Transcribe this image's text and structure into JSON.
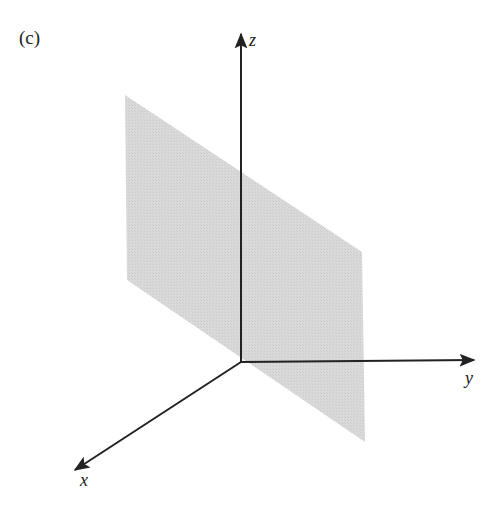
{
  "figure": {
    "panel_label": "(c)",
    "plane_color": "#d8d8d8",
    "axis_color": "#222222",
    "axes": {
      "x": {
        "label": "x"
      },
      "y": {
        "label": "y"
      },
      "z": {
        "label": "z"
      }
    }
  }
}
